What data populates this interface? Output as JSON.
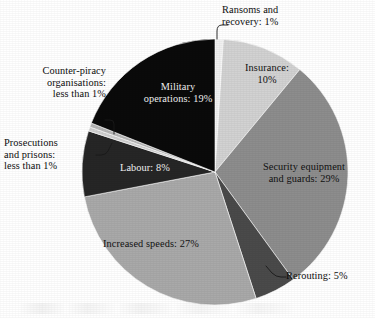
{
  "figure": {
    "background_color": "#ffffff",
    "pie": {
      "center_x": 215,
      "center_y": 172,
      "radius": 133,
      "start_angle_deg": -90,
      "direction": "clockwise",
      "stroke_color": "#ffffff",
      "stroke_width": 0.6
    }
  },
  "chart_data": {
    "type": "pie",
    "title": "",
    "subtitle": "",
    "xlabel": "",
    "ylabel": "",
    "grid": false,
    "legend_position": "none",
    "label_format": "{name}: {value}%",
    "total": 100,
    "units": "percent",
    "categories": [
      "Ransoms and recovery",
      "Insurance",
      "Security equipment and guards",
      "Rerouting",
      "Increased speeds",
      "Labour",
      "Prosecutions and prisons",
      "Counter-piracy organisations",
      "Military operations"
    ],
    "values": [
      1,
      10,
      29,
      5,
      27,
      8,
      0.5,
      0.5,
      19
    ],
    "value_labels": [
      "1%",
      "10%",
      "29%",
      "5%",
      "27%",
      "8%",
      "less than 1%",
      "less than 1%",
      "19%"
    ],
    "colors": [
      "#f0f0f0",
      "#d2d2d2",
      "#8d8d8d",
      "#4a4a4a",
      "#a9a9a9",
      "#262626",
      "#cfcfcf",
      "#b5b5b5",
      "#0a0a0a"
    ],
    "slices": [
      {
        "name": "Ransoms and recovery",
        "value": 1,
        "value_label": "1%",
        "color": "#f0f0f0",
        "label_placement": "outside"
      },
      {
        "name": "Insurance",
        "value": 10,
        "value_label": "10%",
        "color": "#d2d2d2",
        "label_placement": "inside"
      },
      {
        "name": "Security equipment and guards",
        "value": 29,
        "value_label": "29%",
        "color": "#8d8d8d",
        "label_placement": "inside"
      },
      {
        "name": "Rerouting",
        "value": 5,
        "value_label": "5%",
        "color": "#4a4a4a",
        "label_placement": "outside"
      },
      {
        "name": "Increased speeds",
        "value": 27,
        "value_label": "27%",
        "color": "#a9a9a9",
        "label_placement": "inside"
      },
      {
        "name": "Labour",
        "value": 8,
        "value_label": "8%",
        "color": "#262626",
        "label_placement": "inside"
      },
      {
        "name": "Prosecutions and prisons",
        "value": 0.5,
        "value_label": "less than 1%",
        "color": "#cfcfcf",
        "label_placement": "outside"
      },
      {
        "name": "Counter-piracy organisations",
        "value": 0.5,
        "value_label": "less than 1%",
        "color": "#b5b5b5",
        "label_placement": "outside"
      },
      {
        "name": "Military operations",
        "value": 19,
        "value_label": "19%",
        "color": "#0a0a0a",
        "label_placement": "inside"
      }
    ]
  },
  "labels": {
    "ransoms": "Ransoms and\nrecovery: 1%",
    "insurance": "Insurance:\n10%",
    "security": "Security equipment\nand guards: 29%",
    "rerouting": "Rerouting: 5%",
    "speeds": "Increased speeds: 27%",
    "labour": "Labour: 8%",
    "military": "Military\noperations: 19%",
    "counter_piracy": "Counter-piracy\norganisations:\nless than 1%",
    "prosecutions": "Prosecutions\nand prisons:\nless than 1%"
  }
}
